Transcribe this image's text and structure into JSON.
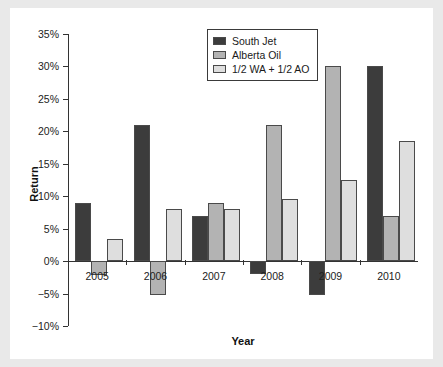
{
  "chart_data": {
    "type": "bar",
    "title": "",
    "xlabel": "Year",
    "ylabel": "Return",
    "categories": [
      "2005",
      "2006",
      "2007",
      "2008",
      "2009",
      "2010"
    ],
    "series": [
      {
        "name": "South Jet",
        "color": "#3c3c3c",
        "values": [
          9,
          21,
          7,
          -2,
          -5.2,
          30
        ]
      },
      {
        "name": "Alberta Oil",
        "color": "#b3b3b3",
        "values": [
          -2.2,
          -5.2,
          9,
          21,
          30,
          7
        ]
      },
      {
        "name": "1/2 WA + 1/2 AO",
        "color": "#dedede",
        "values": [
          3.4,
          8,
          8,
          9.5,
          12.5,
          18.5
        ]
      }
    ],
    "ylim": [
      -10,
      35
    ],
    "ytick_values": [
      35,
      30,
      25,
      20,
      15,
      10,
      5,
      0,
      -5,
      -10
    ],
    "ytick_labels": [
      "35%",
      "30%",
      "25%",
      "20%",
      "15%",
      "10%",
      "5%",
      "0%",
      "−5%",
      "−10%"
    ],
    "grid": false,
    "legend_position": "top-center",
    "legend_entries": [
      "South Jet",
      "Alberta Oil",
      "1/2 WA + 1/2 AO"
    ]
  }
}
